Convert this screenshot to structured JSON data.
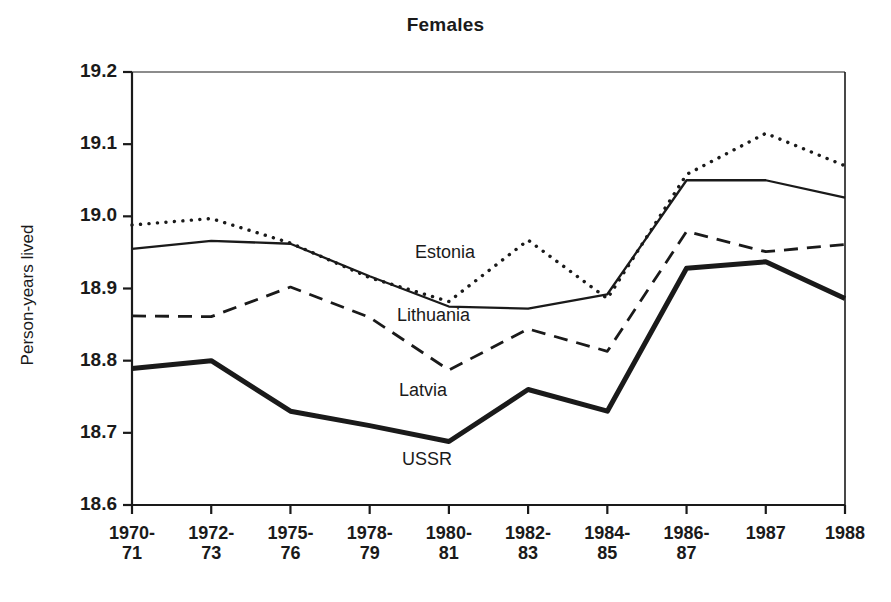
{
  "figure": {
    "title": "Females",
    "ylabel": "Person-years lived"
  },
  "axes": {
    "y_ticks": [
      "19.2",
      "19.1",
      "19.0",
      "18.9",
      "18.8",
      "18.7",
      "18.6"
    ],
    "x_ticks": [
      {
        "line1": "1970-",
        "line2": "71"
      },
      {
        "line1": "1972-",
        "line2": "73"
      },
      {
        "line1": "1975-",
        "line2": "76"
      },
      {
        "line1": "1978-",
        "line2": "79"
      },
      {
        "line1": "1980-",
        "line2": "81"
      },
      {
        "line1": "1982-",
        "line2": "83"
      },
      {
        "line1": "1984-",
        "line2": "85"
      },
      {
        "line1": "1986-",
        "line2": "87"
      },
      {
        "line1": "1987",
        "line2": ""
      },
      {
        "line1": "1988",
        "line2": ""
      }
    ]
  },
  "annotations": [
    {
      "name": "estonia",
      "text": "Estonia"
    },
    {
      "name": "lithuania",
      "text": "Lithuania"
    },
    {
      "name": "latvia",
      "text": "Latvia"
    },
    {
      "name": "ussr",
      "text": "USSR"
    }
  ],
  "chart_data": {
    "type": "line",
    "title": "Females",
    "xlabel": "",
    "ylabel": "Person-years lived",
    "ylim": [
      18.6,
      19.2
    ],
    "ytick_values": [
      19.2,
      19.1,
      19.0,
      18.9,
      18.8,
      18.7,
      18.6
    ],
    "grid": false,
    "legend": "inline-annotations",
    "categories": [
      "1970-71",
      "1972-73",
      "1975-76",
      "1978-79",
      "1980-81",
      "1982-83",
      "1984-85",
      "1986-87",
      "1987",
      "1988"
    ],
    "series": [
      {
        "name": "Estonia",
        "style": "dotted",
        "values": [
          18.988,
          18.997,
          18.963,
          18.915,
          18.882,
          18.967,
          18.886,
          19.058,
          19.115,
          19.07
        ]
      },
      {
        "name": "Lithuania",
        "style": "solid-thin",
        "values": [
          18.955,
          18.966,
          18.962,
          18.917,
          18.875,
          18.872,
          18.892,
          19.05,
          19.05,
          19.026
        ]
      },
      {
        "name": "Latvia",
        "style": "dashed",
        "values": [
          18.862,
          18.861,
          18.902,
          18.86,
          18.787,
          18.844,
          18.813,
          18.979,
          18.951,
          18.961
        ]
      },
      {
        "name": "USSR",
        "style": "solid-thick",
        "values": [
          18.789,
          18.8,
          18.73,
          18.71,
          18.688,
          18.76,
          18.73,
          18.928,
          18.937,
          18.886
        ]
      }
    ]
  }
}
